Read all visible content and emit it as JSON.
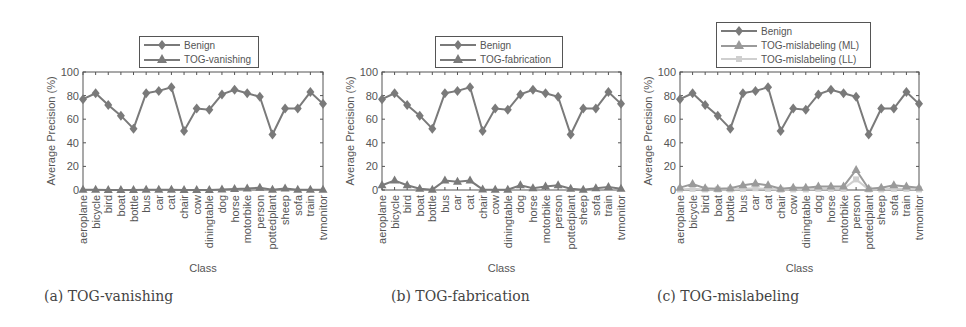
{
  "chart_data": [
    {
      "type": "line",
      "title": "",
      "caption": "(a) TOG-vanishing",
      "xlabel": "Class",
      "ylabel": "Average Precision (%)",
      "ylim": [
        0,
        100
      ],
      "yticks": [
        0,
        20,
        40,
        60,
        80,
        100
      ],
      "grid": false,
      "legend_position": "top-center-outside",
      "categories": [
        "aeroplane",
        "bicycle",
        "bird",
        "boat",
        "bottle",
        "bus",
        "car",
        "cat",
        "chair",
        "cow",
        "diningtable",
        "dog",
        "horse",
        "motorbike",
        "person",
        "pottedplant",
        "sheep",
        "sofa",
        "train",
        "tvmonitor"
      ],
      "series": [
        {
          "name": "Benign",
          "marker": "diamond",
          "color": "#7a7a7a",
          "values": [
            77,
            82,
            72,
            63,
            52,
            82,
            84,
            87,
            50,
            69,
            68,
            81,
            85,
            82,
            79,
            47,
            69,
            69,
            83,
            73
          ]
        },
        {
          "name": "TOG-vanishing",
          "marker": "triangle",
          "color": "#7a7a7a",
          "values": [
            0.3,
            0.2,
            0.1,
            0.1,
            0.1,
            0.3,
            0.2,
            0.2,
            0.1,
            0.1,
            0.1,
            0.5,
            0.8,
            1.2,
            2.0,
            0.2,
            1.2,
            0.2,
            0.2,
            0.2
          ]
        }
      ]
    },
    {
      "type": "line",
      "title": "",
      "caption": "(b) TOG-fabrication",
      "xlabel": "Class",
      "ylabel": "Average Precision (%)",
      "ylim": [
        0,
        100
      ],
      "yticks": [
        0,
        20,
        40,
        60,
        80,
        100
      ],
      "grid": false,
      "legend_position": "top-center-outside",
      "categories": [
        "aeroplane",
        "bicycle",
        "bird",
        "boat",
        "bottle",
        "bus",
        "car",
        "cat",
        "chair",
        "cow",
        "diningtable",
        "dog",
        "horse",
        "motorbike",
        "person",
        "pottedplant",
        "sheep",
        "sofa",
        "train",
        "tvmonitor"
      ],
      "series": [
        {
          "name": "Benign",
          "marker": "diamond",
          "color": "#7a7a7a",
          "values": [
            77,
            82,
            72,
            63,
            52,
            82,
            84,
            87,
            50,
            69,
            68,
            81,
            85,
            82,
            79,
            47,
            69,
            69,
            83,
            73
          ]
        },
        {
          "name": "TOG-fabrication",
          "marker": "triangle",
          "color": "#7a7a7a",
          "values": [
            4,
            8,
            4,
            1,
            0.3,
            8,
            7,
            8,
            0.5,
            0.3,
            0.3,
            4,
            1.5,
            3,
            4,
            1,
            0.3,
            1.5,
            2.5,
            1
          ]
        }
      ]
    },
    {
      "type": "line",
      "title": "",
      "caption": "(c) TOG-mislabeling",
      "xlabel": "Class",
      "ylabel": "Average Precision (%)",
      "ylim": [
        0,
        100
      ],
      "yticks": [
        0,
        20,
        40,
        60,
        80,
        100
      ],
      "grid": false,
      "legend_position": "top-center-outside",
      "categories": [
        "aeroplane",
        "bicycle",
        "bird",
        "boat",
        "bottle",
        "bus",
        "car",
        "cat",
        "chair",
        "cow",
        "diningtable",
        "dog",
        "horse",
        "motorbike",
        "person",
        "pottedplant",
        "sheep",
        "sofa",
        "train",
        "tvmonitor"
      ],
      "series": [
        {
          "name": "Benign",
          "marker": "diamond",
          "color": "#7a7a7a",
          "values": [
            77,
            82,
            72,
            63,
            52,
            82,
            84,
            87,
            50,
            69,
            68,
            81,
            85,
            82,
            79,
            47,
            69,
            69,
            83,
            73
          ]
        },
        {
          "name": "TOG-mislabeling (ML)",
          "marker": "triangle",
          "color": "#9a9a9a",
          "values": [
            2,
            5,
            1.5,
            1,
            1.5,
            4,
            5.5,
            4,
            1,
            2,
            2,
            3,
            3,
            3,
            17,
            1,
            2,
            4,
            3,
            2
          ]
        },
        {
          "name": "TOG-mislabeling (LL)",
          "marker": "square",
          "color": "#cfcfcf",
          "values": [
            0.5,
            1,
            0.5,
            0.5,
            0.5,
            1,
            1.5,
            1,
            0.3,
            0.5,
            0.5,
            1,
            1,
            1,
            9,
            0.5,
            0.5,
            1,
            1,
            0.5
          ]
        }
      ]
    }
  ],
  "panels": [
    {
      "caption": "(a) TOG-vanishing",
      "xlabel": "Class",
      "ylabel": "Average Precision (%)",
      "legend": [
        "Benign",
        "TOG-vanishing"
      ]
    },
    {
      "caption": "(b) TOG-fabrication",
      "xlabel": "Class",
      "ylabel": "Average Precision (%)",
      "legend": [
        "Benign",
        "TOG-fabrication"
      ]
    },
    {
      "caption": "(c) TOG-mislabeling",
      "xlabel": "Class",
      "ylabel": "Average Precision (%)",
      "legend": [
        "Benign",
        "TOG-mislabeling (ML)",
        "TOG-mislabeling (LL)"
      ]
    }
  ]
}
